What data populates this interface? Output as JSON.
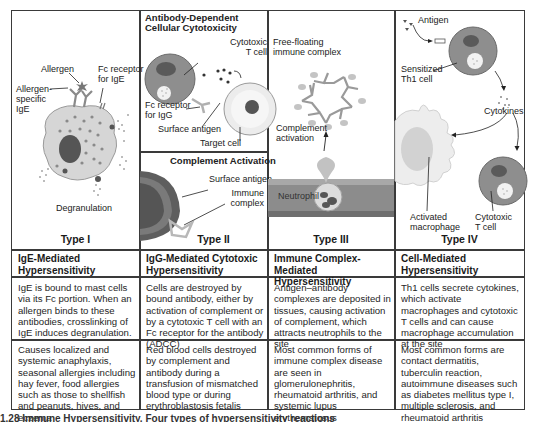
{
  "panels": [
    {
      "type_label": "Type I",
      "labels": {
        "allergen": "Allergen",
        "fc_receptor": "Fc receptor",
        "fc_receptor_2": "for IgE",
        "allergen_specific": "Allergen-",
        "allergen_specific_2": "specific",
        "allergen_specific_3": "IgE",
        "degranulation": "Degranulation"
      },
      "title": "IgE-Mediated\nHypersensitivity",
      "title_line1": "IgE-Mediated",
      "title_line2": "Hypersensitivity",
      "mechanism": "IgE is bound to mast cells via its Fc portion. When an allergen binds to these antibodies, crosslinking of IgE induces degranulation.",
      "examples": "Causes localized and systemic anaphylaxis, seasonal allergies including hay fever, food allergies such as those to shellfish and peanuts, hives, and eczema"
    },
    {
      "type_label": "Type II",
      "subpanels": {
        "adcc_title_1": "Antibody-Dependent",
        "adcc_title_2": "Cellular Cytotoxicity",
        "complement_title": "Complement Activation"
      },
      "labels": {
        "cytotoxic": "Cytotoxic",
        "t_cell": "T cell",
        "fc_receptor": "Fc receptor",
        "fc_receptor_2": "for IgG",
        "surface_antigen": "Surface antigen",
        "target_cell": "Target cell",
        "surface_antigen_2": "Surface antigen",
        "immune": "Immune",
        "complex": "complex"
      },
      "title_line1": "IgG-Mediated Cytotoxic",
      "title_line2": "Hypersensitivity",
      "mechanism": "Cells are destroyed by bound antibody, either by activation of complement or by a cytotoxic T cell with an Fc receptor for the antibody (ADCC)",
      "examples": "Red blood cells destroyed by complement and antibody during a transfusion of mismatched blood type or during erythroblastosis fetalis"
    },
    {
      "type_label": "Type III",
      "labels": {
        "free_floating": "Free-floating",
        "immune_complex": "immune complex",
        "complement": "Complement",
        "activation": "activation",
        "neutrophil": "Neutrophil"
      },
      "title_line1": "Immune Complex-Mediated",
      "title_line2": "Hypersensitivity",
      "mechanism": "Antigen–antibody complexes are deposited in tissues, causing activation of complement, which attracts neutrophils to the site",
      "examples": "Most common forms of immune complex disease are seen in glomerulonephritis, rheumatoid arthritis, and systemic lupus erythematosus"
    },
    {
      "type_label": "Type IV",
      "labels": {
        "antigen": "Antigen",
        "sensitized": "Sensitized",
        "th1_cell": "Th1 cell",
        "cytokines": "Cytokines",
        "activated": "Activated",
        "macrophage": "macrophage",
        "cytotoxic": "Cytotoxic",
        "t_cell": "T cell"
      },
      "title_line1": "Cell-Mediated",
      "title_line2": "Hypersensitivity",
      "mechanism": "Th1 cells secrete cytokines, which activate macrophages and cytotoxic T cells and can cause macrophage accumulation at the site",
      "examples": "Most common forms are contact dermatitis, tuberculin reaction, autoimmune diseases such as diabetes mellitus type I, multiple sclerosis, and rheumatoid arthritis"
    }
  ],
  "caption": "1.28  Immune Hypersensitivity.  Four types of hypersensitivity reactions",
  "colors": {
    "border": "#3a3a3a",
    "cell_fill": "#8a8a8a",
    "cell_light": "#d9d9d9",
    "nucleus": "#4a4a4a",
    "vessel": "#8c8c8c",
    "antibody": "#a0a0a0"
  }
}
